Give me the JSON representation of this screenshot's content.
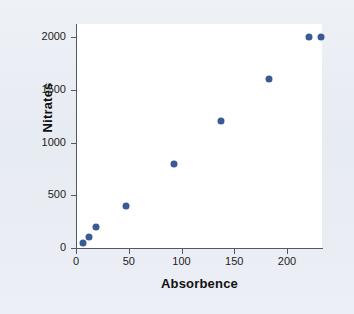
{
  "chart_data": {
    "type": "scatter",
    "title": "",
    "xlabel": "Absorbence",
    "ylabel": "Nitrates",
    "xlim": [
      0,
      234
    ],
    "ylim": [
      0,
      2100
    ],
    "grid": false,
    "legend": null,
    "marker_color": "#3a5a93",
    "xticks": [
      0,
      50,
      100,
      150,
      200
    ],
    "yticks": [
      0,
      500,
      1000,
      1500,
      2000
    ],
    "xticklabels": [
      "0",
      "50",
      "100",
      "150",
      "200"
    ],
    "yticklabels": [
      "0",
      "500",
      "1000",
      "1500",
      "2000"
    ],
    "series": [
      {
        "name": "Nitrates vs Absorbence",
        "points": [
          {
            "x": 7,
            "y": 50
          },
          {
            "x": 12,
            "y": 100
          },
          {
            "x": 19,
            "y": 200
          },
          {
            "x": 47,
            "y": 400
          },
          {
            "x": 93,
            "y": 800
          },
          {
            "x": 137,
            "y": 1200
          },
          {
            "x": 183,
            "y": 1600
          },
          {
            "x": 221,
            "y": 2000
          },
          {
            "x": 232,
            "y": 2000
          }
        ]
      }
    ]
  },
  "figure": {
    "background_color": "#e9edf3",
    "panel_color": "#ffffff",
    "axis_color": "#4f5a66"
  }
}
